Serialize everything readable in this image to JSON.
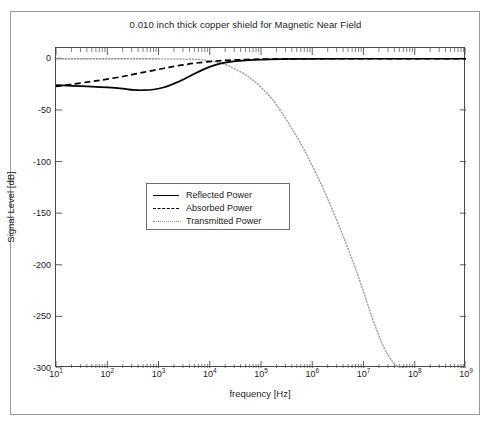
{
  "chart_data": {
    "type": "line",
    "title": "0.010 inch thick copper shield for Magnetic Near Field",
    "xlabel": "frequency [Hz]",
    "ylabel": "Signal Level [dB]",
    "xscale": "log",
    "xlim": [
      10,
      1000000000
    ],
    "ylim": [
      -300,
      10
    ],
    "grid": false,
    "legend_position": "center-left",
    "xticks": [
      {
        "value": 10,
        "label": "10",
        "exponent": "1"
      },
      {
        "value": 100,
        "label": "10",
        "exponent": "2"
      },
      {
        "value": 1000,
        "label": "10",
        "exponent": "3"
      },
      {
        "value": 10000,
        "label": "10",
        "exponent": "4"
      },
      {
        "value": 100000,
        "label": "10",
        "exponent": "5"
      },
      {
        "value": 1000000,
        "label": "10",
        "exponent": "6"
      },
      {
        "value": 10000000,
        "label": "10",
        "exponent": "7"
      },
      {
        "value": 100000000,
        "label": "10",
        "exponent": "8"
      },
      {
        "value": 1000000000,
        "label": "10",
        "exponent": "9"
      }
    ],
    "yticks": [
      {
        "value": 0,
        "label": "0"
      },
      {
        "value": -50,
        "label": "-50"
      },
      {
        "value": -100,
        "label": "-100"
      },
      {
        "value": -150,
        "label": "-150"
      },
      {
        "value": -200,
        "label": "-200"
      },
      {
        "value": -250,
        "label": "-250"
      },
      {
        "value": -300,
        "label": "-300"
      }
    ],
    "series": [
      {
        "name": "Reflected Power",
        "style": "solid",
        "color": "#000000",
        "x": [
          10,
          20,
          50,
          100,
          200,
          320,
          500,
          800,
          1300,
          2000,
          3200,
          5000,
          8000,
          13000,
          20000,
          32000,
          50000,
          100000,
          300000,
          1000000,
          10000000,
          100000000,
          1000000000
        ],
        "y": [
          -26.0,
          -26.6,
          -27.4,
          -28.2,
          -29.4,
          -30.6,
          -30.9,
          -30.2,
          -28.0,
          -24.5,
          -20.0,
          -15.0,
          -10.2,
          -6.4,
          -4.2,
          -2.7,
          -1.9,
          -1.2,
          -0.7,
          -0.5,
          -0.4,
          -0.4,
          -0.4
        ]
      },
      {
        "name": "Absorbed Power",
        "style": "dashed",
        "color": "#000000",
        "x": [
          10,
          20,
          50,
          100,
          200,
          320,
          500,
          800,
          1300,
          2000,
          3200,
          5000,
          8000,
          13000,
          20000,
          32000,
          50000,
          100000,
          300000,
          1000000,
          10000000,
          100000000,
          1000000000
        ],
        "y": [
          -27.2,
          -25.2,
          -22.4,
          -20.2,
          -17.6,
          -15.6,
          -13.6,
          -11.6,
          -9.6,
          -7.8,
          -6.2,
          -4.8,
          -3.6,
          -2.6,
          -2.0,
          -1.5,
          -1.2,
          -0.8,
          -0.5,
          -0.4,
          -0.4,
          -0.4,
          -0.4
        ]
      },
      {
        "name": "Transmitted Power",
        "style": "dotted",
        "color": "#9a9a9a",
        "x": [
          10,
          100,
          1000,
          5000,
          10000,
          20000,
          50000,
          100000,
          200000,
          500000,
          1000000,
          2000000,
          4000000,
          8000000,
          15000000,
          25000000,
          40000000,
          55000000,
          65000000
        ],
        "y": [
          -0.35,
          -0.4,
          -0.5,
          -1.0,
          -2.5,
          -6.0,
          -16.0,
          -28.0,
          -45.0,
          -76.0,
          -104.0,
          -136.0,
          -172.0,
          -212.0,
          -252.0,
          -280.0,
          -296.0,
          -299.5,
          -300.0
        ]
      }
    ]
  },
  "legend": {
    "items": [
      {
        "label": "Reflected Power",
        "style": "solid"
      },
      {
        "label": "Absorbed Power",
        "style": "dashed"
      },
      {
        "label": "Transmitted Power",
        "style": "dotted"
      }
    ]
  }
}
